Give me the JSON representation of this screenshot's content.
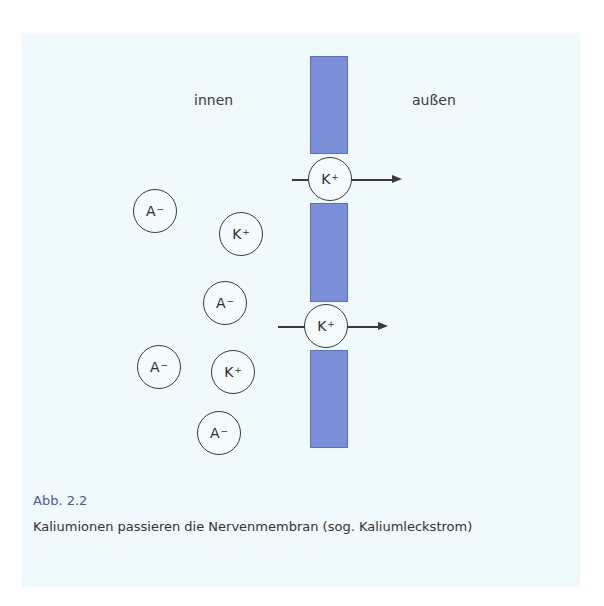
{
  "diagram": {
    "labels": {
      "inside": "innen",
      "outside": "außen"
    },
    "membrane_color": "#7b8ed8",
    "ions": [
      {
        "symbol": "A",
        "charge": "−",
        "name": "anion"
      },
      {
        "symbol": "K",
        "charge": "+",
        "name": "potassium"
      },
      {
        "symbol": "A",
        "charge": "−",
        "name": "anion"
      },
      {
        "symbol": "A",
        "charge": "−",
        "name": "anion"
      },
      {
        "symbol": "K",
        "charge": "+",
        "name": "potassium"
      },
      {
        "symbol": "A",
        "charge": "−",
        "name": "anion"
      }
    ],
    "channel_ions": [
      {
        "symbol": "K",
        "charge": "+"
      },
      {
        "symbol": "K",
        "charge": "+"
      }
    ]
  },
  "caption": {
    "title": "Abb. 2.2",
    "text": "Kaliumionen passieren die Nervenmembran (sog. Kaliumleck­strom)",
    "title_color": "#4a56a8"
  }
}
